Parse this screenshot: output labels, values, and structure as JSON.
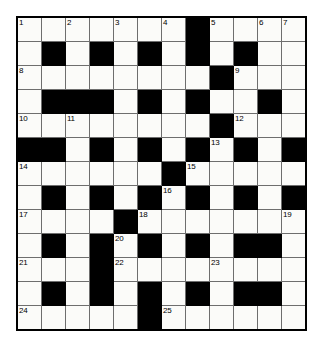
{
  "puzzle": {
    "title": "Crossword Grid",
    "rows": 13,
    "columns": 12,
    "cell_size_px": 23,
    "colors": {
      "block": "#000000",
      "open": "#fbfbf9",
      "grid_line": "#6e6e6e",
      "border": "#000000",
      "number_text": "#000000"
    },
    "numbers_present": [
      1,
      2,
      3,
      4,
      5,
      6,
      7,
      8,
      9,
      10,
      11,
      12,
      13,
      14,
      15,
      16,
      17,
      18,
      19,
      20,
      21,
      22,
      23,
      24,
      25
    ],
    "grid": [
      [
        {
          "block": false,
          "number": "1"
        },
        {
          "block": false,
          "number": ""
        },
        {
          "block": false,
          "number": "2"
        },
        {
          "block": false,
          "number": ""
        },
        {
          "block": false,
          "number": "3"
        },
        {
          "block": false,
          "number": ""
        },
        {
          "block": false,
          "number": "4"
        },
        {
          "block": true,
          "number": ""
        },
        {
          "block": false,
          "number": "5"
        },
        {
          "block": false,
          "number": ""
        },
        {
          "block": false,
          "number": "6"
        },
        {
          "block": false,
          "number": "7"
        }
      ],
      [
        {
          "block": false,
          "number": ""
        },
        {
          "block": true,
          "number": ""
        },
        {
          "block": false,
          "number": ""
        },
        {
          "block": true,
          "number": ""
        },
        {
          "block": false,
          "number": ""
        },
        {
          "block": true,
          "number": ""
        },
        {
          "block": false,
          "number": ""
        },
        {
          "block": true,
          "number": ""
        },
        {
          "block": false,
          "number": ""
        },
        {
          "block": true,
          "number": ""
        },
        {
          "block": false,
          "number": ""
        },
        {
          "block": false,
          "number": ""
        }
      ],
      [
        {
          "block": false,
          "number": "8"
        },
        {
          "block": false,
          "number": ""
        },
        {
          "block": false,
          "number": ""
        },
        {
          "block": false,
          "number": ""
        },
        {
          "block": false,
          "number": ""
        },
        {
          "block": false,
          "number": ""
        },
        {
          "block": false,
          "number": ""
        },
        {
          "block": false,
          "number": ""
        },
        {
          "block": true,
          "number": ""
        },
        {
          "block": false,
          "number": "9"
        },
        {
          "block": false,
          "number": ""
        },
        {
          "block": false,
          "number": ""
        }
      ],
      [
        {
          "block": false,
          "number": ""
        },
        {
          "block": true,
          "number": ""
        },
        {
          "block": true,
          "number": ""
        },
        {
          "block": true,
          "number": ""
        },
        {
          "block": false,
          "number": ""
        },
        {
          "block": true,
          "number": ""
        },
        {
          "block": false,
          "number": ""
        },
        {
          "block": true,
          "number": ""
        },
        {
          "block": false,
          "number": ""
        },
        {
          "block": false,
          "number": ""
        },
        {
          "block": true,
          "number": ""
        },
        {
          "block": false,
          "number": ""
        }
      ],
      [
        {
          "block": false,
          "number": "10"
        },
        {
          "block": false,
          "number": ""
        },
        {
          "block": false,
          "number": "11"
        },
        {
          "block": false,
          "number": ""
        },
        {
          "block": false,
          "number": ""
        },
        {
          "block": false,
          "number": ""
        },
        {
          "block": false,
          "number": ""
        },
        {
          "block": false,
          "number": ""
        },
        {
          "block": true,
          "number": ""
        },
        {
          "block": false,
          "number": "12"
        },
        {
          "block": false,
          "number": ""
        },
        {
          "block": false,
          "number": ""
        }
      ],
      [
        {
          "block": true,
          "number": ""
        },
        {
          "block": true,
          "number": ""
        },
        {
          "block": false,
          "number": ""
        },
        {
          "block": true,
          "number": ""
        },
        {
          "block": false,
          "number": ""
        },
        {
          "block": true,
          "number": ""
        },
        {
          "block": false,
          "number": ""
        },
        {
          "block": true,
          "number": ""
        },
        {
          "block": false,
          "number": "13"
        },
        {
          "block": true,
          "number": ""
        },
        {
          "block": false,
          "number": ""
        },
        {
          "block": true,
          "number": ""
        }
      ],
      [
        {
          "block": false,
          "number": "14"
        },
        {
          "block": false,
          "number": ""
        },
        {
          "block": false,
          "number": ""
        },
        {
          "block": false,
          "number": ""
        },
        {
          "block": false,
          "number": ""
        },
        {
          "block": false,
          "number": ""
        },
        {
          "block": true,
          "number": ""
        },
        {
          "block": false,
          "number": "15"
        },
        {
          "block": false,
          "number": ""
        },
        {
          "block": false,
          "number": ""
        },
        {
          "block": false,
          "number": ""
        },
        {
          "block": false,
          "number": ""
        }
      ],
      [
        {
          "block": false,
          "number": ""
        },
        {
          "block": true,
          "number": ""
        },
        {
          "block": false,
          "number": ""
        },
        {
          "block": true,
          "number": ""
        },
        {
          "block": false,
          "number": ""
        },
        {
          "block": true,
          "number": ""
        },
        {
          "block": false,
          "number": "16"
        },
        {
          "block": true,
          "number": ""
        },
        {
          "block": false,
          "number": ""
        },
        {
          "block": true,
          "number": ""
        },
        {
          "block": false,
          "number": ""
        },
        {
          "block": true,
          "number": ""
        }
      ],
      [
        {
          "block": false,
          "number": "17"
        },
        {
          "block": false,
          "number": ""
        },
        {
          "block": false,
          "number": ""
        },
        {
          "block": false,
          "number": ""
        },
        {
          "block": true,
          "number": ""
        },
        {
          "block": false,
          "number": "18"
        },
        {
          "block": false,
          "number": ""
        },
        {
          "block": false,
          "number": ""
        },
        {
          "block": false,
          "number": ""
        },
        {
          "block": false,
          "number": ""
        },
        {
          "block": false,
          "number": ""
        },
        {
          "block": false,
          "number": "19"
        }
      ],
      [
        {
          "block": false,
          "number": ""
        },
        {
          "block": true,
          "number": ""
        },
        {
          "block": false,
          "number": ""
        },
        {
          "block": true,
          "number": ""
        },
        {
          "block": false,
          "number": "20"
        },
        {
          "block": true,
          "number": ""
        },
        {
          "block": false,
          "number": ""
        },
        {
          "block": true,
          "number": ""
        },
        {
          "block": false,
          "number": ""
        },
        {
          "block": true,
          "number": ""
        },
        {
          "block": true,
          "number": ""
        },
        {
          "block": false,
          "number": ""
        }
      ],
      [
        {
          "block": false,
          "number": "21"
        },
        {
          "block": false,
          "number": ""
        },
        {
          "block": false,
          "number": ""
        },
        {
          "block": true,
          "number": ""
        },
        {
          "block": false,
          "number": "22"
        },
        {
          "block": false,
          "number": ""
        },
        {
          "block": false,
          "number": ""
        },
        {
          "block": false,
          "number": ""
        },
        {
          "block": false,
          "number": "23"
        },
        {
          "block": false,
          "number": ""
        },
        {
          "block": false,
          "number": ""
        },
        {
          "block": false,
          "number": ""
        }
      ],
      [
        {
          "block": false,
          "number": ""
        },
        {
          "block": true,
          "number": ""
        },
        {
          "block": false,
          "number": ""
        },
        {
          "block": true,
          "number": ""
        },
        {
          "block": false,
          "number": ""
        },
        {
          "block": true,
          "number": ""
        },
        {
          "block": false,
          "number": ""
        },
        {
          "block": true,
          "number": ""
        },
        {
          "block": false,
          "number": ""
        },
        {
          "block": true,
          "number": ""
        },
        {
          "block": true,
          "number": ""
        },
        {
          "block": false,
          "number": ""
        }
      ],
      [
        {
          "block": false,
          "number": "24"
        },
        {
          "block": false,
          "number": ""
        },
        {
          "block": false,
          "number": ""
        },
        {
          "block": false,
          "number": ""
        },
        {
          "block": false,
          "number": ""
        },
        {
          "block": true,
          "number": ""
        },
        {
          "block": false,
          "number": "25"
        },
        {
          "block": false,
          "number": ""
        },
        {
          "block": false,
          "number": ""
        },
        {
          "block": false,
          "number": ""
        },
        {
          "block": false,
          "number": ""
        },
        {
          "block": false,
          "number": ""
        }
      ]
    ]
  }
}
